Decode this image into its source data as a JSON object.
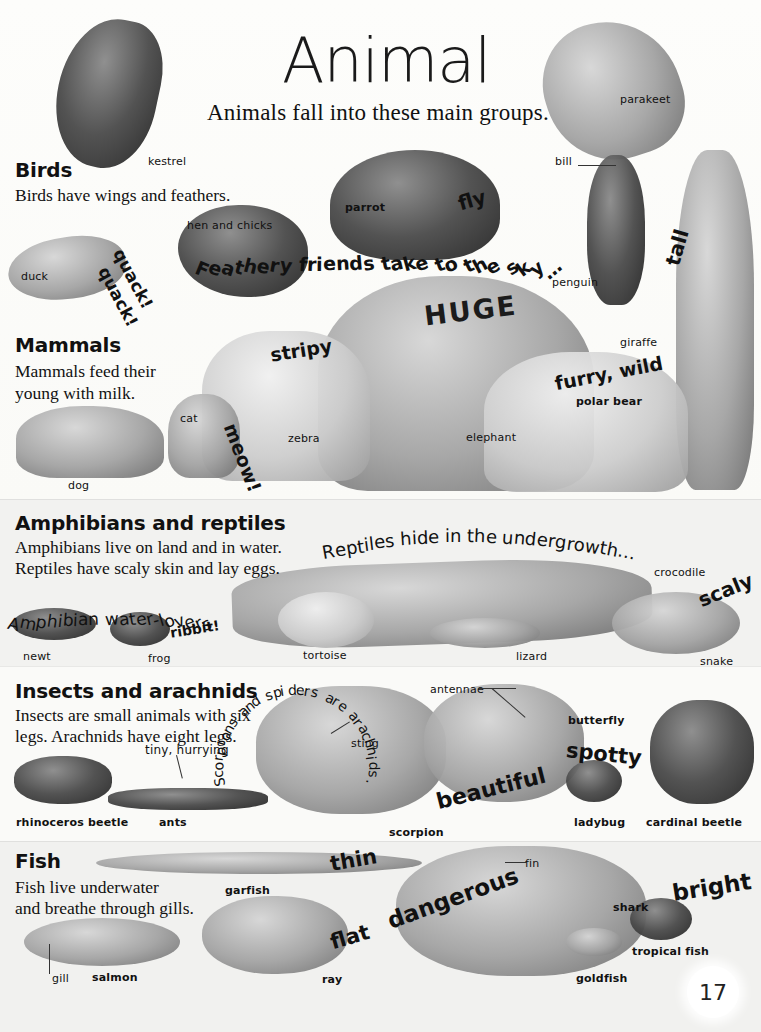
{
  "page": {
    "title": "Animal",
    "subtitle": "Animals fall into these main groups.",
    "page_number": "17",
    "background_color": "#fbfbf8",
    "band_colors": [
      "#fdfdfb",
      "#f2f2f0",
      "#fafaf8",
      "#f1f1ef"
    ]
  },
  "sections": [
    {
      "heading": "Birds",
      "body": "Birds have wings and feathers."
    },
    {
      "heading": "Mammals",
      "body_line1": "Mammals feed their",
      "body_line2": "young with milk."
    },
    {
      "heading": "Amphibians and reptiles",
      "body_line1": "Amphibians live on land and in water.",
      "body_line2": "Reptiles have scaly skin and lay eggs."
    },
    {
      "heading": "Insects and arachnids",
      "body_line1": "Insects are small animals with six",
      "body_line2": "legs. Arachnids have eight legs."
    },
    {
      "heading": "Fish",
      "body_line1": "Fish live underwater",
      "body_line2": "and breathe through gills."
    }
  ],
  "labels": {
    "kestrel": "kestrel",
    "parakeet": "parakeet",
    "parrot": "parrot",
    "bill": "bill",
    "hen_and_chicks": "hen and chicks",
    "duck": "duck",
    "penguin": "penguin",
    "giraffe": "giraffe",
    "cat": "cat",
    "dog": "dog",
    "zebra": "zebra",
    "elephant": "elephant",
    "polar_bear": "polar bear",
    "newt": "newt",
    "frog": "frog",
    "tortoise": "tortoise",
    "lizard": "lizard",
    "crocodile": "crocodile",
    "snake": "snake",
    "rhinoceros_beetle": "rhinoceros beetle",
    "ants": "ants",
    "scorpion": "scorpion",
    "sting": "sting",
    "antennae": "antennae",
    "butterfly": "butterfly",
    "ladybug": "ladybug",
    "cardinal_beetle": "cardinal beetle",
    "garfish": "garfish",
    "gill": "gill",
    "salmon": "salmon",
    "ray": "ray",
    "fin": "fin",
    "shark": "shark",
    "goldfish": "goldfish",
    "tropical_fish": "tropical fish"
  },
  "fun_words": {
    "quack1": "quack!",
    "quack2": "quack!",
    "fly": "fly",
    "tall": "tall",
    "stripy": "stripy",
    "meow": "meow!",
    "huge": "HUGE",
    "furry_wild": "furry, wild",
    "ribbit": "ribbit!",
    "scaly": "scaly",
    "beautiful": "beautiful",
    "spotty": "spotty",
    "thin": "thin",
    "flat": "flat",
    "dangerous": "dangerous",
    "bright": "bright"
  },
  "arc_texts": {
    "feathery": "Feathery friends take to the sky…",
    "reptiles_hide": "Reptiles hide in the undergrowth…",
    "amphibian": "Amphibian water-lovers",
    "scorpions": "Scorpions and spiders are arachnids.",
    "tiny_hurrying": "tiny, hurrying"
  }
}
